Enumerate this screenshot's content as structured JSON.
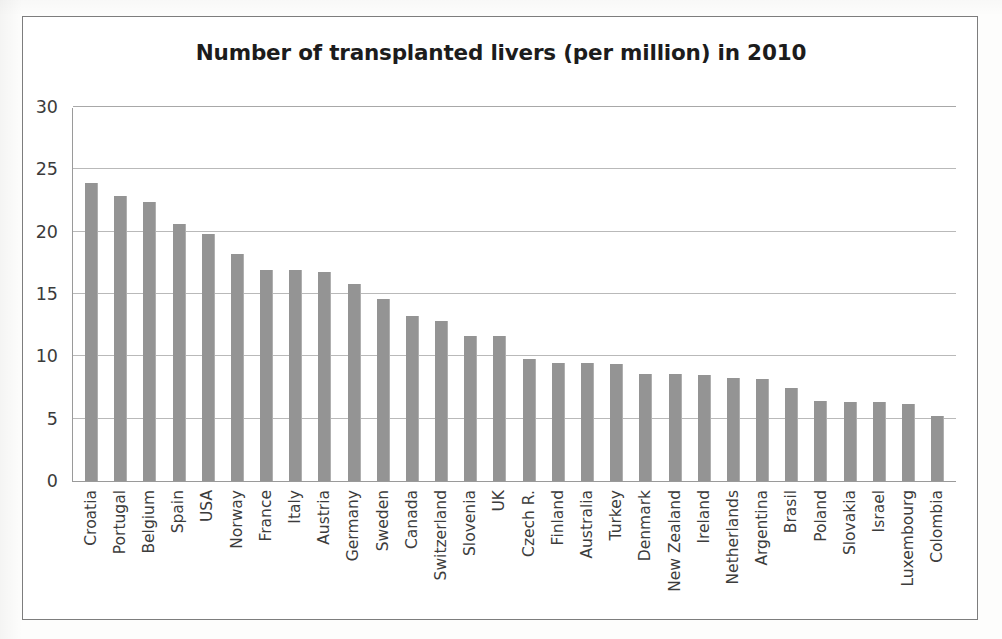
{
  "chart_data": {
    "type": "bar",
    "title": "Number of transplanted livers (per million) in 2010",
    "xlabel": "",
    "ylabel": "",
    "ylim": [
      0,
      30
    ],
    "yticks": [
      30,
      25,
      20,
      15,
      10,
      5,
      0
    ],
    "grid": true,
    "legend": "none",
    "bar_color": "#949494",
    "categories": [
      "Croatia",
      "Portugal",
      "Belgium",
      "Spain",
      "USA",
      "Norway",
      "France",
      "Italy",
      "Austria",
      "Germany",
      "Sweden",
      "Canada",
      "Switzerland",
      "Slovenia",
      "UK",
      "Czech R.",
      "Finland",
      "Australia",
      "Turkey",
      "Denmark",
      "New Zealand",
      "Ireland",
      "Netherlands",
      "Argentina",
      "Brasil",
      "Poland",
      "Slovakia",
      "Israel",
      "Luxembourg",
      "Colombia"
    ],
    "values": [
      23.9,
      22.9,
      22.4,
      20.6,
      19.8,
      18.2,
      16.9,
      16.9,
      16.8,
      15.8,
      14.6,
      13.2,
      12.8,
      11.6,
      11.6,
      9.8,
      9.5,
      9.5,
      9.4,
      8.6,
      8.6,
      8.5,
      8.3,
      8.2,
      7.5,
      6.4,
      6.3,
      6.3,
      6.2,
      5.2
    ]
  }
}
